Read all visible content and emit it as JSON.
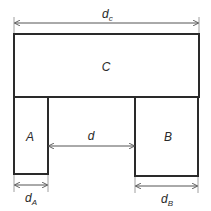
{
  "diagram": {
    "blocks": [
      {
        "id": "C",
        "label": "C"
      },
      {
        "id": "A",
        "label": "A"
      },
      {
        "id": "B",
        "label": "B"
      }
    ],
    "dimensions": {
      "dc": {
        "main": "d",
        "sub": "c"
      },
      "d": {
        "main": "d"
      },
      "dA": {
        "main": "d",
        "sub": "A"
      },
      "dB": {
        "main": "d",
        "sub": "B"
      }
    },
    "colors": {
      "stroke": "#2a2a2a",
      "dimension": "#555555",
      "background": "#ffffff"
    }
  }
}
